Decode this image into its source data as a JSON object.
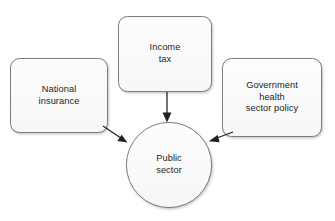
{
  "diagram": {
    "background_color": "#ffffff",
    "node_fill": "#fbfbfb",
    "node_stroke": "#6d6e71",
    "arrow_color": "#231f20",
    "text_color": "#231f20",
    "nodes": [
      {
        "id": "national-insurance",
        "shape": "rounded-rectangle",
        "label": "National\ninsurance",
        "x": 10,
        "y": 58,
        "width": 98,
        "height": 75,
        "radius": 9
      },
      {
        "id": "income-tax",
        "shape": "rounded-rectangle",
        "label": "Income\ntax",
        "x": 118,
        "y": 16,
        "width": 94,
        "height": 76,
        "radius": 9
      },
      {
        "id": "government-health-sector-policy",
        "shape": "rounded-rectangle",
        "label": "Government\nhealth\nsector policy",
        "x": 222,
        "y": 58,
        "width": 100,
        "height": 79,
        "radius": 9
      },
      {
        "id": "public-sector",
        "shape": "circle",
        "label": "Public\nsector",
        "cx": 169,
        "cy": 165,
        "r": 43
      }
    ],
    "edges": [
      {
        "id": "national-insurance-to-public-sector",
        "from": "national-insurance",
        "to": "public-sector",
        "x1": 103,
        "y1": 127,
        "x2": 128,
        "y2": 144,
        "direction": "down-right"
      },
      {
        "id": "income-tax-to-public-sector",
        "from": "income-tax",
        "to": "public-sector",
        "x1": 167,
        "y1": 92,
        "x2": 167,
        "y2": 122,
        "direction": "down"
      },
      {
        "id": "government-to-public-sector",
        "from": "government-health-sector-policy",
        "to": "public-sector",
        "x1": 232,
        "y1": 131,
        "x2": 209,
        "y2": 143,
        "direction": "down-left"
      }
    ]
  }
}
